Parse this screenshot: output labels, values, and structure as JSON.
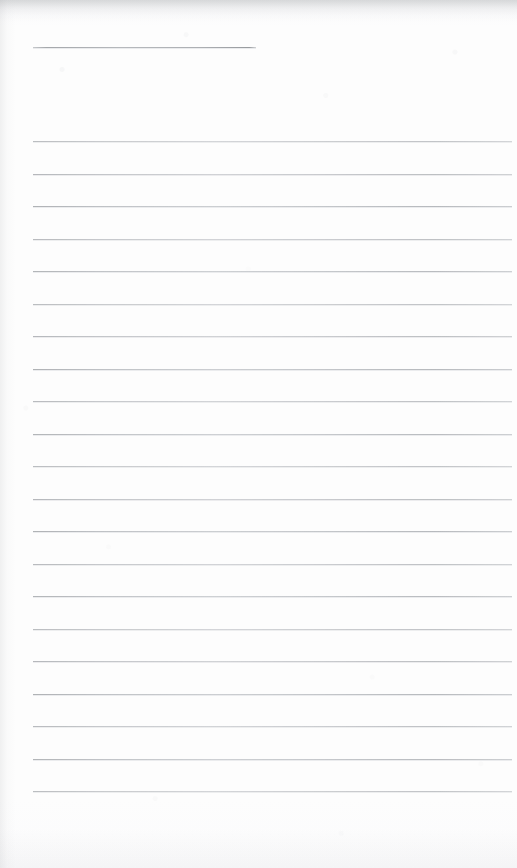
{
  "document": {
    "kind": "scanned-lined-notebook-page",
    "page_width": 517,
    "page_height": 868,
    "paper_color": "#fdfdfd",
    "rule_color": "#bfc3c7",
    "text_content": "",
    "is_blank": true
  },
  "header_rule": {
    "name": "title-underline",
    "x": 33,
    "y": 47,
    "width": 223,
    "thickness": 1
  },
  "ruling": {
    "left_margin": 33,
    "right_edge": 512,
    "line_spacing": 32.5,
    "first_line_y": 141,
    "last_line_y": 800,
    "line_count": 21,
    "lines_y": [
      141,
      173.5,
      206,
      238.5,
      271,
      303.5,
      336,
      368.5,
      401,
      433.5,
      466,
      498.5,
      531,
      563.5,
      596,
      628.5,
      661,
      693.5,
      726,
      758.5,
      791
    ]
  },
  "edges": {
    "top_shadow": true,
    "left_shadow": true,
    "bottom_shadow": true
  }
}
